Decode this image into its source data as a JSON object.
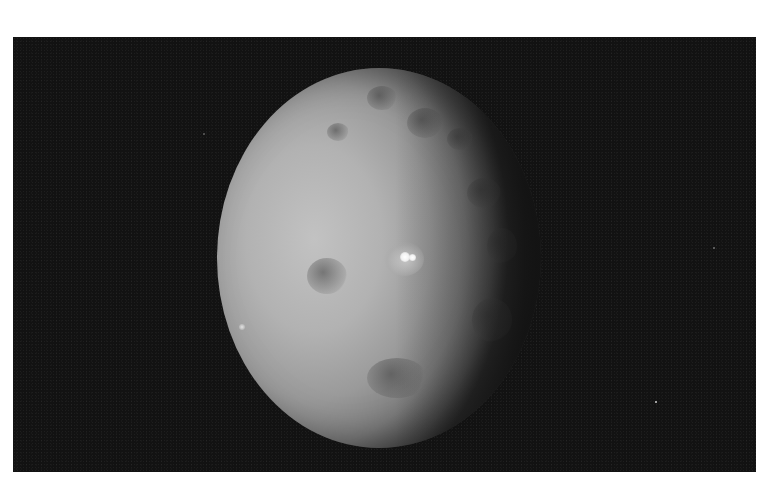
{
  "image": {
    "subject": "dwarf-planet-ceres",
    "description": "Grayscale photograph of a cratered spherical body against black space, lit from the left, with two bright spots near the center",
    "colors": {
      "page_background": "#ffffff",
      "space_background": "#121212",
      "surface_light": "#c2c2c2",
      "surface_shadow": "#3a3a3a",
      "bright_spot": "#ffffff"
    }
  }
}
